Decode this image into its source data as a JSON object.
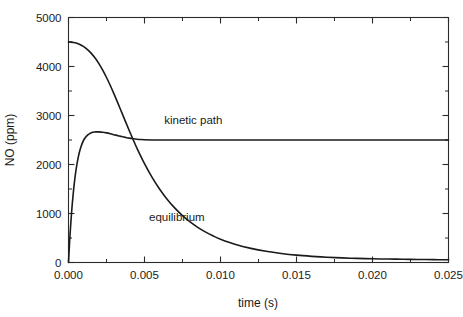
{
  "chart_data": {
    "type": "line",
    "title": "",
    "xlabel": "time (s)",
    "ylabel": "NO (ppm)",
    "xlim": [
      0.0,
      0.025
    ],
    "ylim": [
      0,
      5000
    ],
    "grid": false,
    "legend_position": "inline-annotation",
    "x_ticks": [
      0.0,
      0.005,
      0.01,
      0.015,
      0.02,
      0.025
    ],
    "x_tick_labels": [
      "0.000",
      "0.005",
      "0.010",
      "0.015",
      "0.020",
      "0.025"
    ],
    "x_minor_ticks": [
      0.0025,
      0.0075,
      0.0125,
      0.0175,
      0.0225
    ],
    "y_ticks": [
      0,
      1000,
      2000,
      3000,
      4000,
      5000
    ],
    "y_tick_labels": [
      "0",
      "1000",
      "2000",
      "3000",
      "4000",
      "5000"
    ],
    "y_minor_ticks": [
      500,
      1500,
      2500,
      3500,
      4500
    ],
    "annotations": [
      {
        "text": "kinetic path",
        "x": 0.0063,
        "y": 2830
      },
      {
        "text": "equilibrium",
        "x": 0.0053,
        "y": 850
      }
    ],
    "series": [
      {
        "name": "equilibrium",
        "x": [
          0.0,
          0.00015,
          0.0003,
          0.0005,
          0.00075,
          0.001,
          0.00125,
          0.0015,
          0.00175,
          0.002,
          0.00225,
          0.0025,
          0.00275,
          0.003,
          0.00325,
          0.0035,
          0.00375,
          0.004,
          0.00425,
          0.0045,
          0.005,
          0.0055,
          0.006,
          0.0065,
          0.007,
          0.0075,
          0.008,
          0.0085,
          0.009,
          0.0095,
          0.01,
          0.011,
          0.012,
          0.013,
          0.014,
          0.015,
          0.016,
          0.017,
          0.018,
          0.019,
          0.02,
          0.021,
          0.022,
          0.023,
          0.024,
          0.025
        ],
        "y": [
          4500,
          4498,
          4492,
          4478,
          4448,
          4404,
          4345,
          4268,
          4172,
          4058,
          3926,
          3776,
          3612,
          3436,
          3252,
          3064,
          2876,
          2690,
          2510,
          2336,
          2018,
          1738,
          1496,
          1288,
          1110,
          958,
          828,
          718,
          624,
          544,
          476,
          368,
          288,
          228,
          184,
          150,
          126,
          108,
          94,
          84,
          76,
          70,
          66,
          62,
          58,
          55
        ]
      },
      {
        "name": "kinetic path",
        "x": [
          0.0,
          5e-05,
          0.0001,
          0.0002,
          0.0003,
          0.0004,
          0.0005,
          0.00065,
          0.0008,
          0.001,
          0.00125,
          0.0015,
          0.00175,
          0.002,
          0.00225,
          0.0025,
          0.00275,
          0.003,
          0.00325,
          0.0035,
          0.00375,
          0.004,
          0.00425,
          0.0045,
          0.00475,
          0.005,
          0.0055,
          0.006,
          0.007,
          0.008,
          0.01,
          0.0125,
          0.015,
          0.0175,
          0.02,
          0.0225,
          0.025
        ],
        "y": [
          0,
          290,
          560,
          1010,
          1370,
          1665,
          1900,
          2160,
          2340,
          2500,
          2600,
          2650,
          2665,
          2665,
          2658,
          2645,
          2628,
          2608,
          2588,
          2570,
          2553,
          2538,
          2526,
          2516,
          2509,
          2505,
          2501,
          2500,
          2500,
          2500,
          2500,
          2500,
          2500,
          2500,
          2500,
          2500,
          2500
        ]
      }
    ]
  }
}
